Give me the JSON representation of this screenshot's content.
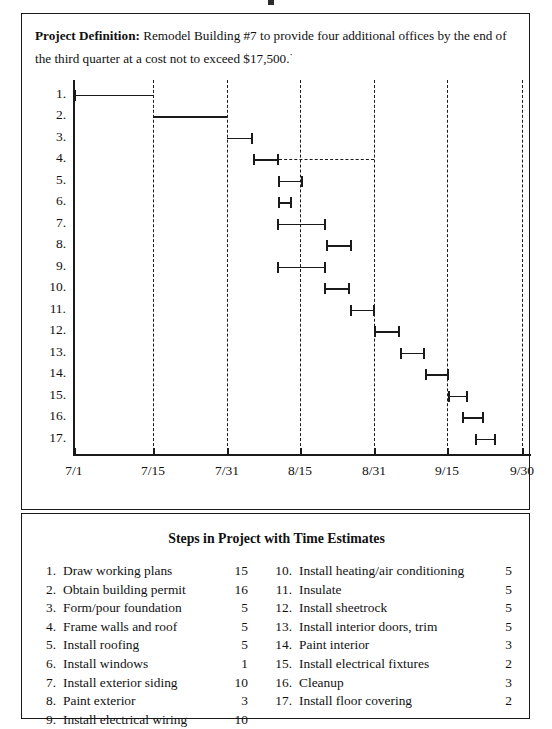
{
  "project_definition": {
    "label": "Project Definition:",
    "text": " Remodel Building #7 to provide four additional offices by the end of the third quarter at a cost not to exceed $17,500.",
    "trailing_mark": "·"
  },
  "chart_data": {
    "type": "bar",
    "orientation": "horizontal-gantt",
    "title": "",
    "xlabel": "",
    "ylabel": "",
    "grid": true,
    "legend": null,
    "x_axis": {
      "tick_labels": [
        "7/1",
        "7/15",
        "7/31",
        "8/15",
        "8/31",
        "9/15",
        "9/30"
      ],
      "tick_pixels": [
        52,
        131,
        205,
        278,
        352,
        425,
        500
      ],
      "range_start": "7/1",
      "range_end": "9/30"
    },
    "row_labels": [
      "1.",
      "2.",
      "3.",
      "4.",
      "5.",
      "6.",
      "7.",
      "8.",
      "9.",
      "10.",
      "11.",
      "12.",
      "13.",
      "14.",
      "15.",
      "16.",
      "17."
    ],
    "tasks": [
      {
        "id": 1,
        "label": "1.",
        "start_px": 52,
        "end_px": 131,
        "duration_days": 15,
        "caps": "left-only",
        "slack_end_px": null
      },
      {
        "id": 2,
        "label": "2.",
        "start_px": 131,
        "end_px": 205,
        "duration_days": 16,
        "caps": "none",
        "slack_end_px": null
      },
      {
        "id": 3,
        "label": "3.",
        "start_px": 205,
        "end_px": 231,
        "duration_days": 5,
        "caps": "right-only",
        "slack_end_px": null
      },
      {
        "id": 4,
        "label": "4.",
        "start_px": 231,
        "end_px": 257,
        "duration_days": 5,
        "caps": "both",
        "slack_end_px": 352
      },
      {
        "id": 5,
        "label": "5.",
        "start_px": 256,
        "end_px": 281,
        "duration_days": 5,
        "caps": "both",
        "slack_end_px": null
      },
      {
        "id": 6,
        "label": "6.",
        "start_px": 256,
        "end_px": 270,
        "duration_days": 1,
        "caps": "both",
        "slack_end_px": null
      },
      {
        "id": 7,
        "label": "7.",
        "start_px": 255,
        "end_px": 304,
        "duration_days": 10,
        "caps": "both",
        "slack_end_px": null
      },
      {
        "id": 8,
        "label": "8.",
        "start_px": 304,
        "end_px": 330,
        "duration_days": 3,
        "caps": "both",
        "slack_end_px": null
      },
      {
        "id": 9,
        "label": "9.",
        "start_px": 255,
        "end_px": 304,
        "duration_days": 10,
        "caps": "both",
        "slack_end_px": null
      },
      {
        "id": 10,
        "label": "10.",
        "start_px": 302,
        "end_px": 328,
        "duration_days": 5,
        "caps": "both",
        "slack_end_px": null
      },
      {
        "id": 11,
        "label": "11.",
        "start_px": 328,
        "end_px": 353,
        "duration_days": 5,
        "caps": "both",
        "slack_end_px": null
      },
      {
        "id": 12,
        "label": "12.",
        "start_px": 352,
        "end_px": 378,
        "duration_days": 5,
        "caps": "both",
        "slack_end_px": null
      },
      {
        "id": 13,
        "label": "13.",
        "start_px": 378,
        "end_px": 403,
        "duration_days": 5,
        "caps": "both",
        "slack_end_px": null
      },
      {
        "id": 14,
        "label": "14.",
        "start_px": 403,
        "end_px": 427,
        "duration_days": 3,
        "caps": "both",
        "slack_end_px": null
      },
      {
        "id": 15,
        "label": "15.",
        "start_px": 426,
        "end_px": 446,
        "duration_days": 2,
        "caps": "both",
        "slack_end_px": null
      },
      {
        "id": 16,
        "label": "16.",
        "start_px": 440,
        "end_px": 462,
        "duration_days": 3,
        "caps": "both",
        "slack_end_px": null
      },
      {
        "id": 17,
        "label": "17.",
        "start_px": 453,
        "end_px": 474,
        "duration_days": 2,
        "caps": "both",
        "slack_end_px": null
      }
    ]
  },
  "steps_table": {
    "title": "Steps in Project with Time Estimates",
    "left_column": [
      {
        "num": "1.",
        "name": "Draw working plans",
        "days": "15"
      },
      {
        "num": "2.",
        "name": "Obtain building permit",
        "days": "16"
      },
      {
        "num": "3.",
        "name": "Form/pour foundation",
        "days": "5"
      },
      {
        "num": "4.",
        "name": "Frame walls and roof",
        "days": "5"
      },
      {
        "num": "5.",
        "name": "Install roofing",
        "days": "5"
      },
      {
        "num": "6.",
        "name": "Install windows",
        "days": "1"
      },
      {
        "num": "7.",
        "name": "Install exterior siding",
        "days": "10"
      },
      {
        "num": "8.",
        "name": "Paint exterior",
        "days": "3"
      },
      {
        "num": "9.",
        "name": "Install electrical wiring",
        "days": "10"
      }
    ],
    "right_column": [
      {
        "num": "10.",
        "name": "Install heating/air conditioning",
        "days": "5"
      },
      {
        "num": "11.",
        "name": "Insulate",
        "days": "5"
      },
      {
        "num": "12.",
        "name": "Install sheetrock",
        "days": "5"
      },
      {
        "num": "13.",
        "name": "Install interior doors, trim",
        "days": "5"
      },
      {
        "num": "14.",
        "name": "Paint interior",
        "days": "3"
      },
      {
        "num": "15.",
        "name": "Install electrical fixtures",
        "days": "2"
      },
      {
        "num": "16.",
        "name": "Cleanup",
        "days": "3"
      },
      {
        "num": "17.",
        "name": "Install floor covering",
        "days": "2"
      }
    ]
  },
  "colors": {
    "ink": "#1a1a1a",
    "page": "#ffffff"
  }
}
